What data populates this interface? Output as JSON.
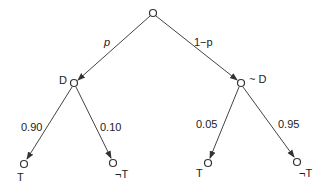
{
  "diagram": {
    "type": "probability-tree",
    "nodes": {
      "root": {
        "label": ""
      },
      "D": {
        "label": "D"
      },
      "notD": {
        "label": "~ D"
      },
      "D_T": {
        "label": "T"
      },
      "D_notT": {
        "label": "¬T"
      },
      "notD_T": {
        "label": "T"
      },
      "notD_notT": {
        "label": "¬T"
      }
    },
    "edges": {
      "root_D": {
        "label": "p"
      },
      "root_notD": {
        "label": "1−p"
      },
      "D_T": {
        "label": "0.90"
      },
      "D_notT": {
        "label": "0.10"
      },
      "notD_T": {
        "label": "0.05"
      },
      "notD_notT": {
        "label": "0.95"
      }
    },
    "colors": {
      "line": "#444444",
      "node_fill": "#ffffff",
      "text": "#222222"
    }
  }
}
